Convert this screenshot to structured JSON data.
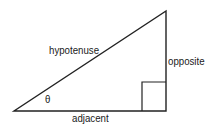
{
  "diagram": {
    "type": "right-triangle",
    "labels": {
      "hypotenuse": "hypotenuse",
      "opposite": "opposite",
      "adjacent": "adjacent",
      "angle": "θ"
    },
    "colors": {
      "stroke": "#222222",
      "text": "#1a1a1a",
      "background": "#ffffff"
    }
  }
}
